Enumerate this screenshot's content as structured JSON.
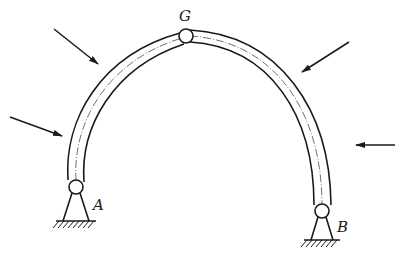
{
  "diagram": {
    "type": "three-hinged arch",
    "labels": {
      "crown_hinge": "G",
      "left_support": "A",
      "right_support": "B"
    },
    "forces": [
      {
        "name": "left-lower-force",
        "direction": "inward-down-right"
      },
      {
        "name": "left-upper-force",
        "direction": "inward-down-right"
      },
      {
        "name": "right-upper-force",
        "direction": "inward-down-left"
      },
      {
        "name": "right-lower-force",
        "direction": "inward-left"
      }
    ],
    "colors": {
      "line": "#1a1a1a",
      "background": "#ffffff"
    }
  }
}
